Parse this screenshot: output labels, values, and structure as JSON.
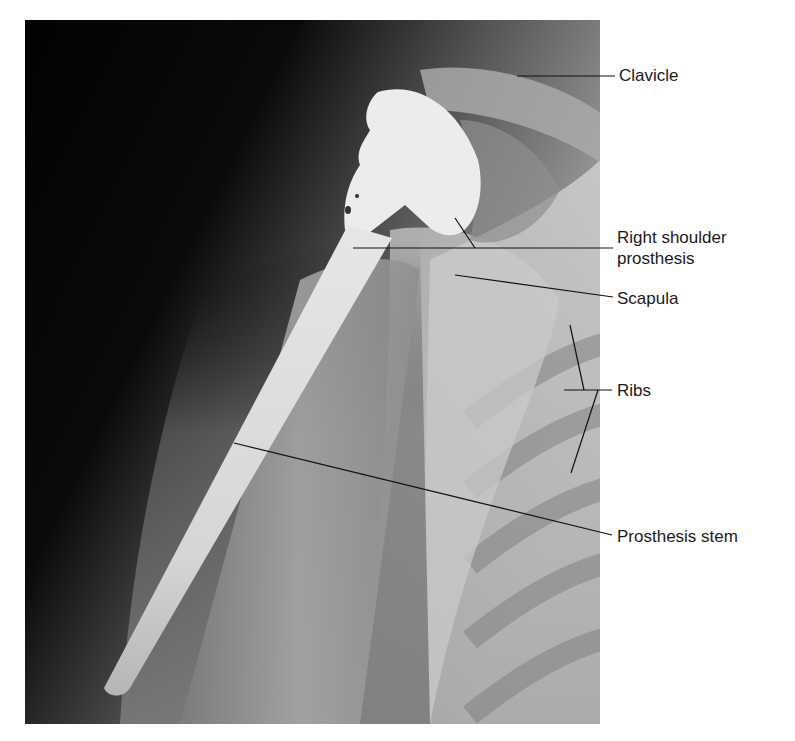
{
  "figure": {
    "labels": {
      "clavicle": "Clavicle",
      "prosthesis_line1": "Right shoulder",
      "prosthesis_line2": "prosthesis",
      "scapula": "Scapula",
      "ribs": "Ribs",
      "stem": "Prosthesis stem"
    }
  }
}
